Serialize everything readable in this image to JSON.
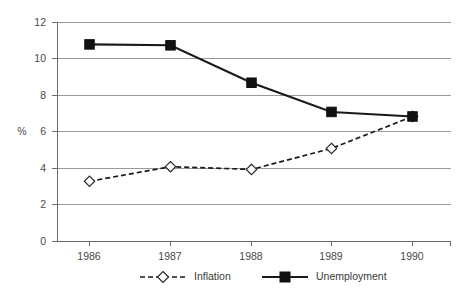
{
  "chart_data": {
    "type": "line",
    "title": "",
    "xlabel": "",
    "ylabel": "%",
    "categories": [
      "1986",
      "1987",
      "1988",
      "1989",
      "1990"
    ],
    "series": [
      {
        "name": "Inflation",
        "values": [
          3.3,
          4.1,
          3.95,
          5.1,
          6.85
        ],
        "marker": "open-diamond",
        "line": "dashed"
      },
      {
        "name": "Unemployment",
        "values": [
          10.8,
          10.75,
          8.7,
          7.1,
          6.85
        ],
        "marker": "filled-square",
        "line": "solid"
      }
    ],
    "ylim": [
      0,
      12
    ],
    "yticks": [
      0,
      2,
      4,
      6,
      8,
      10,
      12
    ],
    "ytick_labels": [
      "0",
      "2",
      "4",
      "6",
      "8",
      "10",
      "12"
    ],
    "grid": true,
    "grid_axis": "y",
    "legend_position": "bottom",
    "colors": {
      "line": "#1a1a1a",
      "grid": "#9a9a9a",
      "axis": "#6a6a6a",
      "text": "#3a3a3a",
      "background": "#ffffff",
      "marker_fill_open": "#ffffff",
      "marker_fill_solid": "#111111"
    }
  },
  "axis": {
    "y_title": "%",
    "y_tick_labels": [
      "12",
      "10",
      "8",
      "6",
      "4",
      "2",
      "0"
    ],
    "x_tick_labels": [
      "1986",
      "1987",
      "1988",
      "1989",
      "1990"
    ]
  },
  "legend": {
    "items": [
      {
        "label": "Inflation"
      },
      {
        "label": "Unemployment"
      }
    ]
  }
}
